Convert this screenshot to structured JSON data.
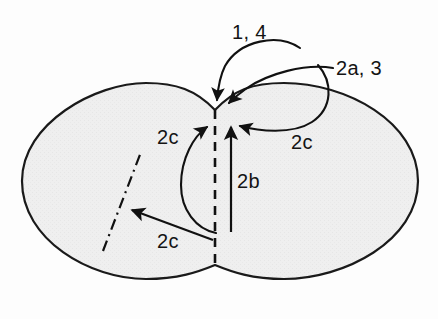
{
  "figure": {
    "name": "two-lobed-region-with-annotated-arrows",
    "background_color": "#fdfdfd",
    "shape": {
      "name": "peanut-shaped-region",
      "fill_color": "#efefef",
      "stroke_color": "#1a1a1a",
      "stroke_width": 2
    },
    "dashed_axis": {
      "name": "vertical-dashed-interface-line",
      "color": "#111111",
      "style": "dashed"
    },
    "dash_dot_line": {
      "name": "dash-dot-line-left-lobe",
      "color": "#111111",
      "style": "dash-dot"
    },
    "labels": [
      {
        "id": "label-1-4",
        "text": "1, 4",
        "x": 232,
        "y": 22
      },
      {
        "id": "label-2a-3",
        "text": "2a, 3",
        "x": 336,
        "y": 58
      },
      {
        "id": "label-2c-left",
        "text": "2c",
        "x": 157,
        "y": 127
      },
      {
        "id": "label-2c-right",
        "text": "2c",
        "x": 291,
        "y": 132
      },
      {
        "id": "label-2b",
        "text": "2b",
        "x": 237,
        "y": 171
      },
      {
        "id": "label-2c-bottom",
        "text": "2c",
        "x": 157,
        "y": 231
      }
    ],
    "arrows": [
      {
        "id": "arrow-1-4",
        "label": "1, 4",
        "target": "waist-top",
        "style": "curved"
      },
      {
        "id": "arrow-2a-3",
        "label": "2a, 3",
        "target": "waist-top",
        "style": "curved"
      },
      {
        "id": "arrow-2c-left",
        "label": "2c",
        "target": "waist-left",
        "style": "curved"
      },
      {
        "id": "arrow-2c-right",
        "label": "2c",
        "target": "waist-right",
        "style": "curved"
      },
      {
        "id": "arrow-2b",
        "label": "2b",
        "target": "waist-below",
        "style": "straight-vertical"
      },
      {
        "id": "arrow-2c-bottom",
        "label": "2c",
        "target": "dash-dot-line",
        "style": "straight-diagonal"
      }
    ]
  }
}
